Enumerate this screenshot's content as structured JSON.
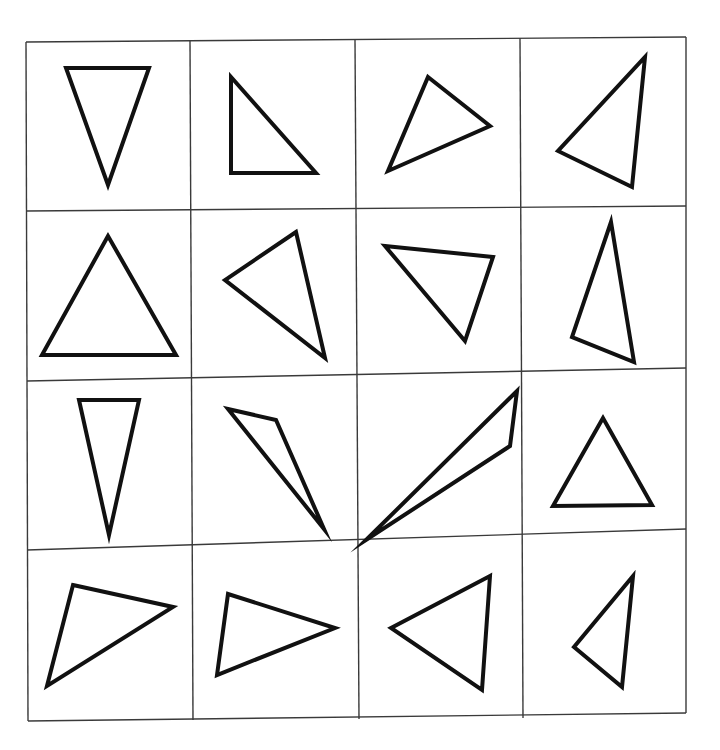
{
  "page": {
    "background": "#ffffff",
    "width": 720,
    "height": 750
  },
  "grid": {
    "rows": 4,
    "cols": 4,
    "line_color": "#3a3a3a",
    "corners": {
      "top_left": [
        26,
        42
      ],
      "top_right": [
        686,
        37
      ],
      "bottom_left": [
        28,
        721
      ],
      "bottom_right": [
        686,
        713
      ]
    },
    "vertical_lines": [
      [
        [
          26,
          42
        ],
        [
          28,
          721
        ]
      ],
      [
        [
          190,
          41
        ],
        [
          193,
          720
        ]
      ],
      [
        [
          355,
          40
        ],
        [
          359,
          719
        ]
      ],
      [
        [
          520,
          38
        ],
        [
          523,
          718
        ]
      ],
      [
        [
          686,
          37
        ],
        [
          686,
          713
        ]
      ]
    ],
    "horizontal_lines": [
      [
        [
          26,
          42
        ],
        [
          686,
          37
        ]
      ],
      [
        [
          26,
          211
        ],
        [
          686,
          206
        ]
      ],
      [
        [
          27,
          381
        ],
        [
          686,
          368
        ]
      ],
      [
        [
          27,
          550
        ],
        [
          686,
          529
        ]
      ],
      [
        [
          28,
          721
        ],
        [
          686,
          713
        ]
      ]
    ]
  },
  "shape_style": {
    "stroke": "#111111",
    "fill": "none",
    "stroke_width": 4
  },
  "cells": [
    {
      "row": 0,
      "col": 0,
      "shape": "triangle",
      "points": [
        [
          66,
          68
        ],
        [
          149,
          68
        ],
        [
          108,
          185
        ]
      ]
    },
    {
      "row": 0,
      "col": 1,
      "shape": "triangle",
      "points": [
        [
          231,
          77
        ],
        [
          231,
          173
        ],
        [
          316,
          173
        ]
      ]
    },
    {
      "row": 0,
      "col": 2,
      "shape": "triangle",
      "points": [
        [
          428,
          77
        ],
        [
          490,
          126
        ],
        [
          388,
          171
        ]
      ]
    },
    {
      "row": 0,
      "col": 3,
      "shape": "triangle",
      "points": [
        [
          645,
          57
        ],
        [
          632,
          187
        ],
        [
          558,
          151
        ]
      ]
    },
    {
      "row": 1,
      "col": 0,
      "shape": "triangle",
      "points": [
        [
          108,
          236
        ],
        [
          42,
          355
        ],
        [
          176,
          355
        ]
      ]
    },
    {
      "row": 1,
      "col": 1,
      "shape": "triangle",
      "points": [
        [
          296,
          232
        ],
        [
          225,
          280
        ],
        [
          325,
          358
        ]
      ]
    },
    {
      "row": 1,
      "col": 2,
      "shape": "triangle",
      "points": [
        [
          385,
          246
        ],
        [
          493,
          257
        ],
        [
          465,
          341
        ]
      ]
    },
    {
      "row": 1,
      "col": 3,
      "shape": "triangle",
      "points": [
        [
          611,
          222
        ],
        [
          572,
          337
        ],
        [
          634,
          362
        ]
      ]
    },
    {
      "row": 2,
      "col": 0,
      "shape": "triangle",
      "points": [
        [
          79,
          400
        ],
        [
          139,
          400
        ],
        [
          109,
          535
        ]
      ]
    },
    {
      "row": 2,
      "col": 1,
      "shape": "triangle",
      "points": [
        [
          228,
          409
        ],
        [
          276,
          420
        ],
        [
          324,
          529
        ]
      ]
    },
    {
      "row": 2,
      "col": 2,
      "shape": "triangle",
      "points": [
        [
          517,
          391
        ],
        [
          510,
          446
        ],
        [
          366,
          540
        ]
      ]
    },
    {
      "row": 2,
      "col": 3,
      "shape": "triangle",
      "points": [
        [
          603,
          418
        ],
        [
          553,
          506
        ],
        [
          652,
          505
        ]
      ]
    },
    {
      "row": 3,
      "col": 0,
      "shape": "triangle",
      "points": [
        [
          73,
          585
        ],
        [
          173,
          607
        ],
        [
          47,
          686
        ]
      ]
    },
    {
      "row": 3,
      "col": 1,
      "shape": "triangle",
      "points": [
        [
          228,
          594
        ],
        [
          335,
          628
        ],
        [
          217,
          675
        ]
      ]
    },
    {
      "row": 3,
      "col": 2,
      "shape": "triangle",
      "points": [
        [
          490,
          576
        ],
        [
          391,
          628
        ],
        [
          482,
          690
        ]
      ]
    },
    {
      "row": 3,
      "col": 3,
      "shape": "triangle",
      "points": [
        [
          633,
          576
        ],
        [
          574,
          647
        ],
        [
          622,
          687
        ]
      ]
    }
  ]
}
